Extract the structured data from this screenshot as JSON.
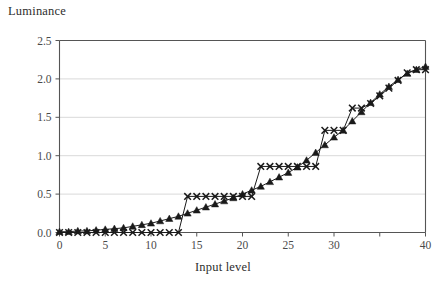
{
  "chart_data": {
    "type": "line",
    "title": "Luminance",
    "xlabel": "Input level",
    "ylabel": "Luminance",
    "xlim": [
      0,
      40
    ],
    "ylim": [
      0,
      2.5
    ],
    "xticks": [
      0,
      5,
      10,
      15,
      20,
      25,
      30,
      35,
      40
    ],
    "xtick_labels": [
      "0",
      "5",
      "10",
      "15",
      "20",
      "25",
      "30",
      "35",
      "40"
    ],
    "xtick_labels_shown": [
      "0",
      "5",
      "10",
      "15",
      "20",
      "25",
      "30",
      "40"
    ],
    "yticks": [
      0.0,
      0.5,
      1.0,
      1.5,
      2.0,
      2.5
    ],
    "ytick_labels": [
      "0.0",
      "0.5",
      "1.0",
      "1.5",
      "2.0",
      "2.5"
    ],
    "grid": "horizontal",
    "legend": "none",
    "x": [
      0,
      1,
      2,
      3,
      4,
      5,
      6,
      7,
      8,
      9,
      10,
      11,
      12,
      13,
      14,
      15,
      16,
      17,
      18,
      19,
      20,
      21,
      22,
      23,
      24,
      25,
      26,
      27,
      28,
      29,
      30,
      31,
      32,
      33,
      34,
      35,
      36,
      37,
      38,
      39,
      40
    ],
    "series": [
      {
        "name": "triangle-series",
        "marker": "triangle",
        "color": "#1a1a1a",
        "values": [
          0.01,
          0.01,
          0.02,
          0.02,
          0.03,
          0.04,
          0.05,
          0.06,
          0.08,
          0.1,
          0.12,
          0.15,
          0.18,
          0.21,
          0.25,
          0.29,
          0.33,
          0.37,
          0.41,
          0.45,
          0.5,
          0.55,
          0.6,
          0.66,
          0.72,
          0.78,
          0.85,
          0.94,
          1.04,
          1.14,
          1.24,
          1.33,
          1.45,
          1.57,
          1.69,
          1.8,
          1.9,
          1.99,
          2.07,
          2.12,
          2.16
        ]
      },
      {
        "name": "cross-series",
        "marker": "x",
        "color": "#1a1a1a",
        "values": [
          0.0,
          0.0,
          0.0,
          0.0,
          0.0,
          0.0,
          0.0,
          0.0,
          0.0,
          0.0,
          0.0,
          0.0,
          0.0,
          0.0,
          0.47,
          0.47,
          0.47,
          0.47,
          0.47,
          0.47,
          0.47,
          0.47,
          0.86,
          0.86,
          0.86,
          0.86,
          0.86,
          0.86,
          0.86,
          1.33,
          1.33,
          1.33,
          1.62,
          1.62,
          1.68,
          1.78,
          1.88,
          1.98,
          2.08,
          2.12,
          2.12
        ]
      }
    ]
  },
  "colors": {
    "axis": "#555555",
    "grid": "#d9d9d9",
    "marker": "#1a1a1a",
    "text": "#3a3a3a",
    "background": "#ffffff"
  }
}
